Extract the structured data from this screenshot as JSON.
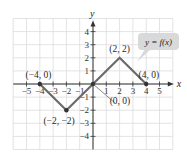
{
  "chart_data": {
    "type": "line",
    "title": "",
    "xlabel": "x",
    "ylabel": "y",
    "function_label": "y = f(x)",
    "xlim": [
      -6,
      6
    ],
    "ylim": [
      -5,
      5
    ],
    "grid": true,
    "x_ticks": [
      -5,
      -4,
      -3,
      -2,
      -1,
      1,
      2,
      3,
      4,
      5
    ],
    "y_ticks": [
      -4,
      -3,
      -2,
      -1,
      1,
      2,
      3,
      4
    ],
    "x_tick_labels": [
      "−5",
      "−4",
      "−3",
      "−2",
      "−1",
      "1",
      "2",
      "3",
      "4",
      "5"
    ],
    "y_tick_labels": [
      "−4",
      "−3",
      "−2",
      "−1",
      "1",
      "2",
      "3",
      "4"
    ],
    "series": [
      {
        "name": "f(x)",
        "x": [
          -4,
          -2,
          0,
          2,
          4
        ],
        "y": [
          0,
          -2,
          0,
          2,
          0
        ]
      }
    ],
    "annotations": [
      {
        "text": "(−4, 0)",
        "x": -4,
        "y": 0
      },
      {
        "text": "(−2, −2)",
        "x": -2,
        "y": -2
      },
      {
        "text": "(0, 0)",
        "x": 0,
        "y": 0
      },
      {
        "text": "(2, 2)",
        "x": 2,
        "y": 2
      },
      {
        "text": "(4, 0)",
        "x": 4,
        "y": 0
      }
    ]
  },
  "colors": {
    "grid": "#dcdcdc",
    "axis": "#333333",
    "line": "#6b6b6b",
    "point": "#333333",
    "label_box": "#d9d9d9"
  }
}
